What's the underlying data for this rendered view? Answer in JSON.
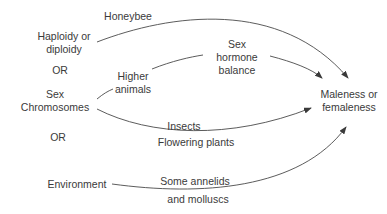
{
  "diagram": {
    "sources": {
      "haploidy": {
        "line1": "Haploidy or",
        "line2": "diploidy"
      },
      "or1": "OR",
      "sex_chromosomes": {
        "line1": "Sex",
        "line2": "Chromosomes"
      },
      "or2": "OR",
      "environment": "Environment"
    },
    "intermediate": {
      "sex_hormone_balance": {
        "line1": "Sex",
        "line2": "hormone",
        "line3": "balance"
      }
    },
    "target": {
      "line1": "Maleness or",
      "line2": "femaleness"
    },
    "edge_labels": {
      "honeybee": "Honeybee",
      "higher_animals": {
        "line1": "Higher",
        "line2": "animals"
      },
      "insects": "Insects",
      "flowering_plants": "Flowering plants",
      "some_annelids": "Some annelids",
      "and_molluscs": "and molluscs"
    },
    "colors": {
      "text": "#3a3a3a",
      "line": "#4a4a4a",
      "background": "#ffffff"
    }
  }
}
